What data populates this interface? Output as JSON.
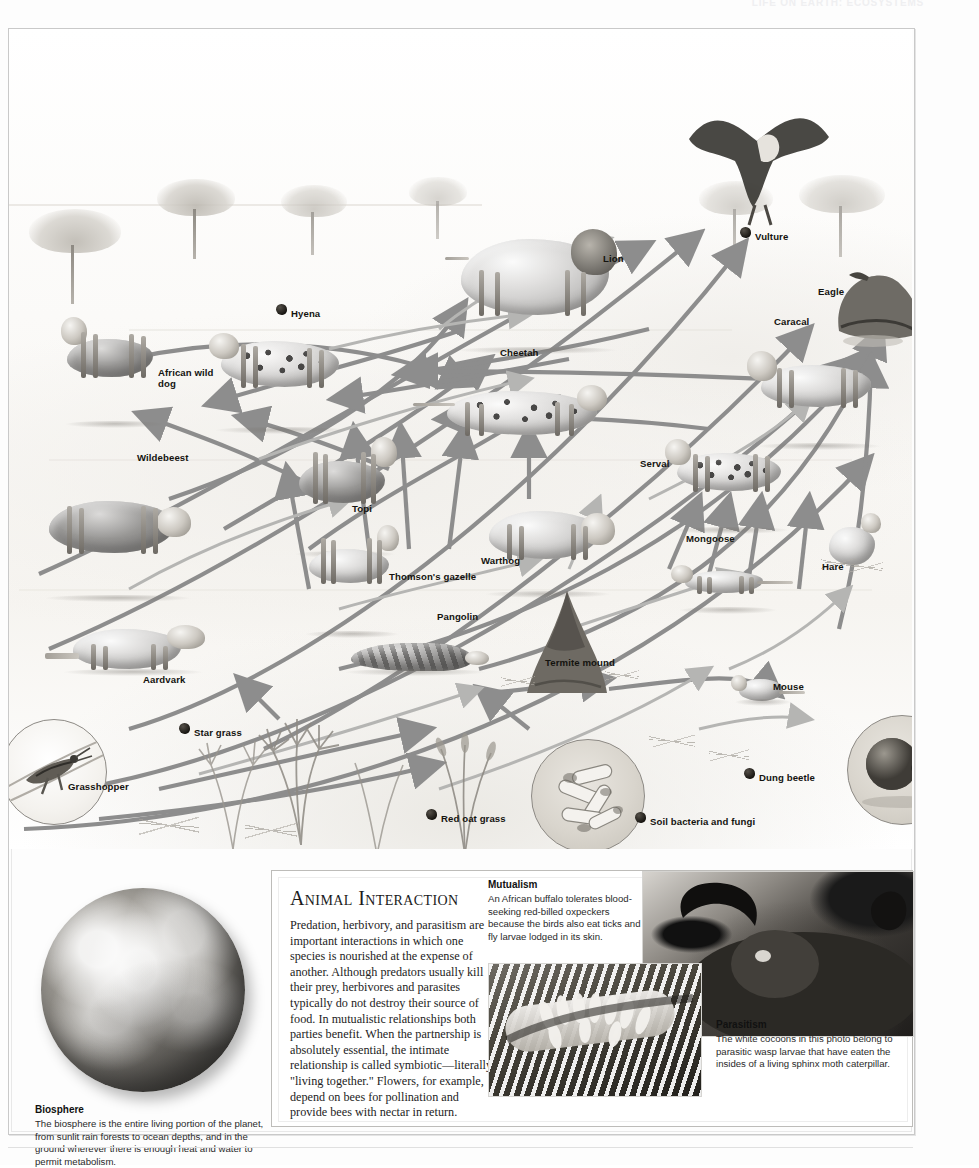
{
  "running_head": "LIFE ON EARTH: ECOSYSTEMS",
  "intro": {
    "title": "Savanna food web",
    "body": "The animals of the Serengeti savanna interact over food in ways that ecologists consider a functional ecosystem. Shown here are typical species, not to scale, interconnected in a food web, with energy flowing from the producers (plants) to the herbivores, carnivores, and top carnivores. Dung beetles, fungi, and soil bacteria recycle much of the ecosystem's minerals for subsequent generations of plants and animals."
  },
  "web": {
    "labels": [
      {
        "name": "Vulture",
        "x": 755,
        "y": 231,
        "bullet": true
      },
      {
        "name": "Eagle",
        "x": 818,
        "y": 286,
        "bullet": false
      },
      {
        "name": "Lion",
        "x": 603,
        "y": 253,
        "bullet": false
      },
      {
        "name": "Caracal",
        "x": 774,
        "y": 316,
        "bullet": false
      },
      {
        "name": "Hyena",
        "x": 291,
        "y": 308,
        "bullet": true
      },
      {
        "name": "Cheetah",
        "x": 500,
        "y": 347,
        "bullet": false
      },
      {
        "name": "African wild dog",
        "x": 158,
        "y": 367,
        "bullet": false
      },
      {
        "name": "Serval",
        "x": 640,
        "y": 458,
        "bullet": false
      },
      {
        "name": "Wildebeest",
        "x": 137,
        "y": 452,
        "bullet": false
      },
      {
        "name": "Topi",
        "x": 352,
        "y": 503,
        "bullet": false
      },
      {
        "name": "Warthog",
        "x": 481,
        "y": 555,
        "bullet": false
      },
      {
        "name": "Mongoose",
        "x": 686,
        "y": 533,
        "bullet": false
      },
      {
        "name": "Hare",
        "x": 822,
        "y": 561,
        "bullet": false
      },
      {
        "name": "Thomson's gazelle",
        "x": 389,
        "y": 571,
        "bullet": false
      },
      {
        "name": "Pangolin",
        "x": 437,
        "y": 611,
        "bullet": false
      },
      {
        "name": "Termite mound",
        "x": 545,
        "y": 657,
        "bullet": false
      },
      {
        "name": "Aardvark",
        "x": 143,
        "y": 674,
        "bullet": false
      },
      {
        "name": "Mouse",
        "x": 773,
        "y": 681,
        "bullet": false
      },
      {
        "name": "Star grass",
        "x": 194,
        "y": 727,
        "bullet": true
      },
      {
        "name": "Dung beetle",
        "x": 759,
        "y": 772,
        "bullet": true
      },
      {
        "name": "Grasshopper",
        "x": 68,
        "y": 781,
        "bullet": false
      },
      {
        "name": "Red oat grass",
        "x": 441,
        "y": 813,
        "bullet": true
      },
      {
        "name": "Soil bacteria and fungi",
        "x": 650,
        "y": 816,
        "bullet": true
      }
    ],
    "arrow_color": "#8d8d8d",
    "arrow_color_light": "#b5b5b3"
  },
  "biosphere": {
    "title": "Biosphere",
    "body": "The biosphere is the entire living portion of the planet, from sunlit rain forests to ocean depths, and in the ground wherever there is enough heat and water to permit metabolism."
  },
  "animal_interaction": {
    "title": "Animal Interaction",
    "body": "Predation, herbivory, and parasitism are important interactions in which one species is nourished at the expense of another. Although predators usually kill their prey, herbivores and parasites typically do not destroy their source of food. In mutualistic relationships both parties benefit. When the partnership is absolutely essential, the intimate relationship is called symbiotic—literally, \"living together.\" Flowers, for example, depend on bees for pollination and provide bees with nectar in return.",
    "mutualism": {
      "title": "Mutualism",
      "body": "An African buffalo tolerates blood-seeking red-billed oxpeckers because the birds also eat ticks and fly larvae lodged in its skin."
    },
    "parasitism": {
      "title": "Parasitism",
      "body": "The white cocoons in this photo belong to parasitic wasp larvae that have eaten the insides of a living sphinx moth caterpillar."
    }
  }
}
